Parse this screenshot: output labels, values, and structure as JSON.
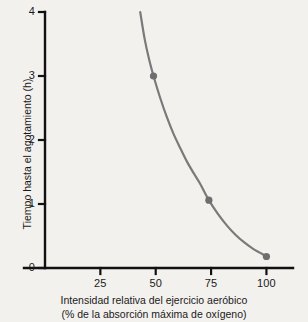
{
  "chart_data": {
    "type": "line",
    "title": "",
    "subtitle": "",
    "xlabel": "Intensidad relativa del ejercicio aeróbico",
    "xlabel_line2": "(% de la absorción máxima de oxígeno)",
    "ylabel": "Tiempo hasta el agotamiento (h)",
    "xlim": [
      0,
      112
    ],
    "ylim": [
      0,
      4
    ],
    "xticks": [
      25,
      50,
      75,
      100
    ],
    "xtick_labels": [
      "25",
      "50",
      "75",
      "100"
    ],
    "yticks": [
      0,
      1,
      2,
      3,
      4
    ],
    "ytick_labels": [
      "0",
      "1",
      "2",
      "3",
      "4"
    ],
    "grid": false,
    "legend": "none",
    "series": [
      {
        "name": "Tiempo hasta el agotamiento",
        "color": "#7a7a7a",
        "curve_points": [
          [
            43.0,
            4.0
          ],
          [
            45.0,
            3.58
          ],
          [
            47.0,
            3.26
          ],
          [
            49.0,
            3.0
          ],
          [
            52.0,
            2.66
          ],
          [
            55.0,
            2.36
          ],
          [
            58.0,
            2.1
          ],
          [
            61.0,
            1.88
          ],
          [
            64.0,
            1.67
          ],
          [
            67.0,
            1.49
          ],
          [
            70.0,
            1.32
          ],
          [
            74.0,
            1.06
          ],
          [
            78.0,
            0.85
          ],
          [
            82.0,
            0.67
          ],
          [
            86.0,
            0.52
          ],
          [
            90.0,
            0.4
          ],
          [
            94.0,
            0.3
          ],
          [
            97.0,
            0.24
          ],
          [
            100.0,
            0.18
          ]
        ],
        "markers": [
          {
            "x": 49,
            "y": 3.0
          },
          {
            "x": 74,
            "y": 1.06
          },
          {
            "x": 100,
            "y": 0.18
          }
        ]
      }
    ],
    "colors": {
      "axis": "#111111",
      "curve": "#7a7a7a",
      "marker": "#6e6e6e",
      "text": "#1a1a1a",
      "background": "#f3f1ee"
    }
  }
}
